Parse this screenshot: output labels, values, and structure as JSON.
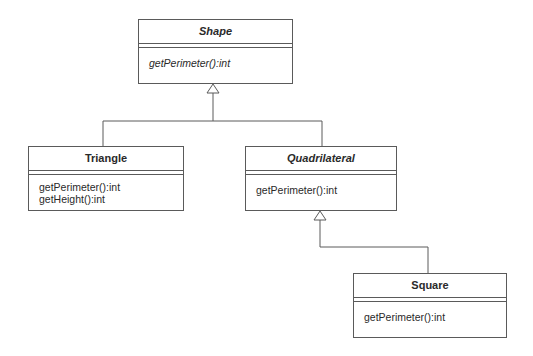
{
  "diagram": {
    "type": "UML class diagram",
    "classes": [
      {
        "id": "shape",
        "name": "Shape",
        "abstract": true,
        "operations": [
          "getPerimeter():int"
        ]
      },
      {
        "id": "triangle",
        "name": "Triangle",
        "abstract": false,
        "operations": [
          "getPerimeter():int",
          "getHeight():int"
        ]
      },
      {
        "id": "quadrilateral",
        "name": "Quadrilateral",
        "abstract": true,
        "operations": [
          "getPerimeter():int"
        ]
      },
      {
        "id": "square",
        "name": "Square",
        "abstract": false,
        "operations": [
          "getPerimeter():int"
        ]
      }
    ],
    "relationships": [
      {
        "type": "generalization",
        "from": "Triangle",
        "to": "Shape"
      },
      {
        "type": "generalization",
        "from": "Quadrilateral",
        "to": "Shape"
      },
      {
        "type": "generalization",
        "from": "Square",
        "to": "Quadrilateral"
      }
    ],
    "colors": {
      "line": "#5a5a5a",
      "text": "#2a2a2a",
      "background": "#ffffff"
    }
  }
}
